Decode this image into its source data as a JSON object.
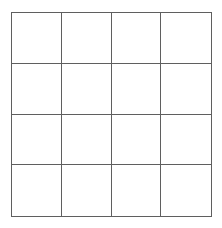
{
  "diagram": {
    "type": "grid",
    "rows": 4,
    "columns": 4,
    "line_color": "#5f5f5f",
    "background_color": "#ffffff",
    "cells": [
      [
        "",
        "",
        "",
        ""
      ],
      [
        "",
        "",
        "",
        ""
      ],
      [
        "",
        "",
        "",
        ""
      ],
      [
        "",
        "",
        "",
        ""
      ]
    ]
  }
}
